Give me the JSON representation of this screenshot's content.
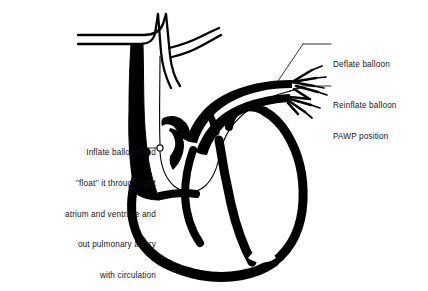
{
  "figure": {
    "background_color": "#ffffff",
    "ink_color": "#000000",
    "text_color": "#151515"
  },
  "annotations": {
    "deflate": {
      "label": "Deflate balloon",
      "position": "right",
      "leader_from": [
        332,
        44
      ],
      "leader_to": [
        296,
        44
      ],
      "pointer_to": [
        272,
        88
      ]
    },
    "reinflate": {
      "label_line1": "Reinflate balloon",
      "label_line2": "PAWP position",
      "position": "right",
      "leader_from": [
        332,
        86
      ],
      "leader_to": [
        300,
        86
      ],
      "pointer_to": [
        286,
        91
      ]
    },
    "inflate": {
      "line1": "Inflate balloon and",
      "line2": "’’float’’ it through right",
      "line3": "atrium and ventricle and",
      "line4": "out pulmonary artery",
      "line5": "with circulation",
      "position": "left",
      "leader_from": [
        157,
        148
      ],
      "leader_to": [
        141,
        148
      ],
      "balloon_marker": [
        160,
        148
      ]
    }
  },
  "anatomy": {
    "parts": [
      "superior-vena-cava",
      "aortic-arch",
      "brachiocephalic-branches",
      "pulmonary-artery",
      "pulmonary-artery-branches",
      "right-atrium",
      "right-ventricle",
      "left-ventricle",
      "cardiac-apex",
      "catheter-line",
      "catheter-balloon"
    ]
  }
}
